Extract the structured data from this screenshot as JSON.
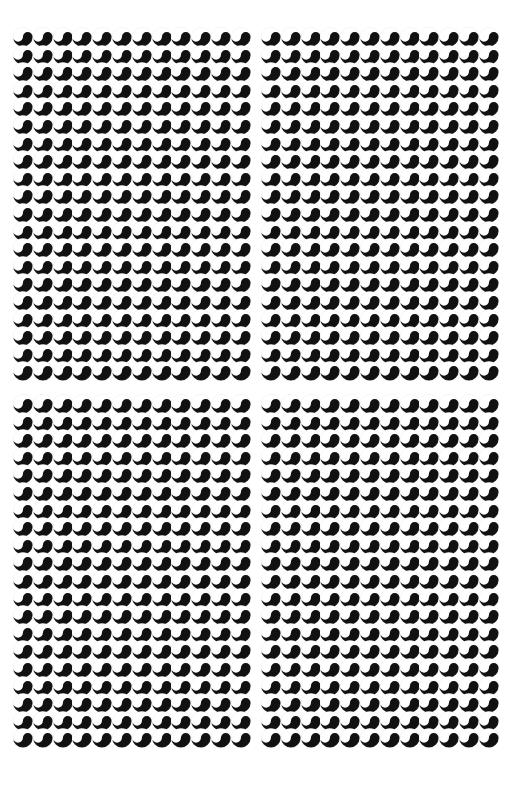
{
  "figure": {
    "title": "Tadpole / yin-yang disc grid optical illusion",
    "background_color": "#ffffff",
    "width": 519,
    "height": 797,
    "element_name": "tadpole-disc",
    "element_description": "circle with white upper-left lobe and black lower-right lobe separated by an S-curve"
  },
  "style": {
    "disc_dark_color": "#111111",
    "disc_light_color": "#ffffff",
    "disc_outline_color": "#d8d8d8",
    "disc_outline_width": 0.7
  },
  "layout": {
    "panel_count": 4,
    "panel_arrangement": "2x2",
    "columns_per_panel": 12,
    "rows_per_panel": 20,
    "cell_width": 19.8,
    "cell_height": 17.6,
    "disc_diameter": 19.8,
    "row_overlap": 2.2
  },
  "panels": [
    {
      "name": "panel-top-left",
      "position": "top-left",
      "left": 13,
      "top": 27,
      "columns": 12,
      "rows": 20,
      "orientation": "s-curve-right",
      "row_phase_offset": 0
    },
    {
      "name": "panel-top-right",
      "position": "top-right",
      "left": 261,
      "top": 27,
      "columns": 12,
      "rows": 20,
      "orientation": "s-curve-right",
      "row_phase_offset": 0
    },
    {
      "name": "panel-bottom-left",
      "position": "bottom-left",
      "left": 13,
      "top": 394,
      "columns": 12,
      "rows": 20,
      "orientation": "s-curve-right",
      "row_phase_offset": 0
    },
    {
      "name": "panel-bottom-right",
      "position": "bottom-right",
      "left": 261,
      "top": 394,
      "columns": 12,
      "rows": 20,
      "orientation": "s-curve-right",
      "row_phase_offset": 0
    }
  ],
  "chart_data": {
    "type": "heatmap",
    "title": "Tadpole / yin-yang disc grid optical illusion",
    "xlabel": "",
    "ylabel": "",
    "grid": false,
    "legend": "none",
    "categories": [
      "panel-top-left",
      "panel-top-right",
      "panel-bottom-left",
      "panel-bottom-right"
    ],
    "values": [
      240,
      240,
      240,
      240
    ]
  }
}
